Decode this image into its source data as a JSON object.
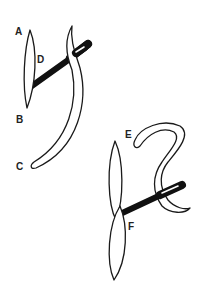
{
  "figure": {
    "colors": {
      "ink": "#1a1a1a",
      "background": "#ffffff"
    }
  },
  "labels": {
    "A": "A",
    "B": "B",
    "C": "C",
    "D": "D",
    "E": "E",
    "F": "F"
  }
}
